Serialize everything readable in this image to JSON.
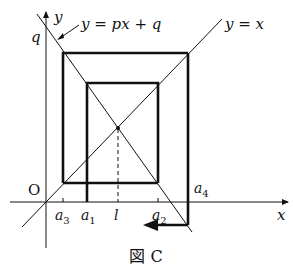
{
  "diagram": {
    "caption": "図 C",
    "caption_parts": {
      "kanji": "図",
      "letter": "C"
    },
    "axes": {
      "x_label": "x",
      "y_label": "y",
      "origin_label": "O",
      "y_intercept_label": "q"
    },
    "lines": {
      "diagonal": {
        "label": "y = x"
      },
      "decreasing": {
        "label": "y = px + q"
      }
    },
    "x_ticks": [
      {
        "label": "a",
        "sub": "3"
      },
      {
        "label": "a",
        "sub": "1"
      },
      {
        "label": "l",
        "sub": ""
      },
      {
        "label": "a",
        "sub": "2"
      }
    ],
    "a4_label": {
      "label": "a",
      "sub": "4"
    },
    "colors": {
      "ink": "#111111",
      "background": "#ffffff"
    }
  }
}
